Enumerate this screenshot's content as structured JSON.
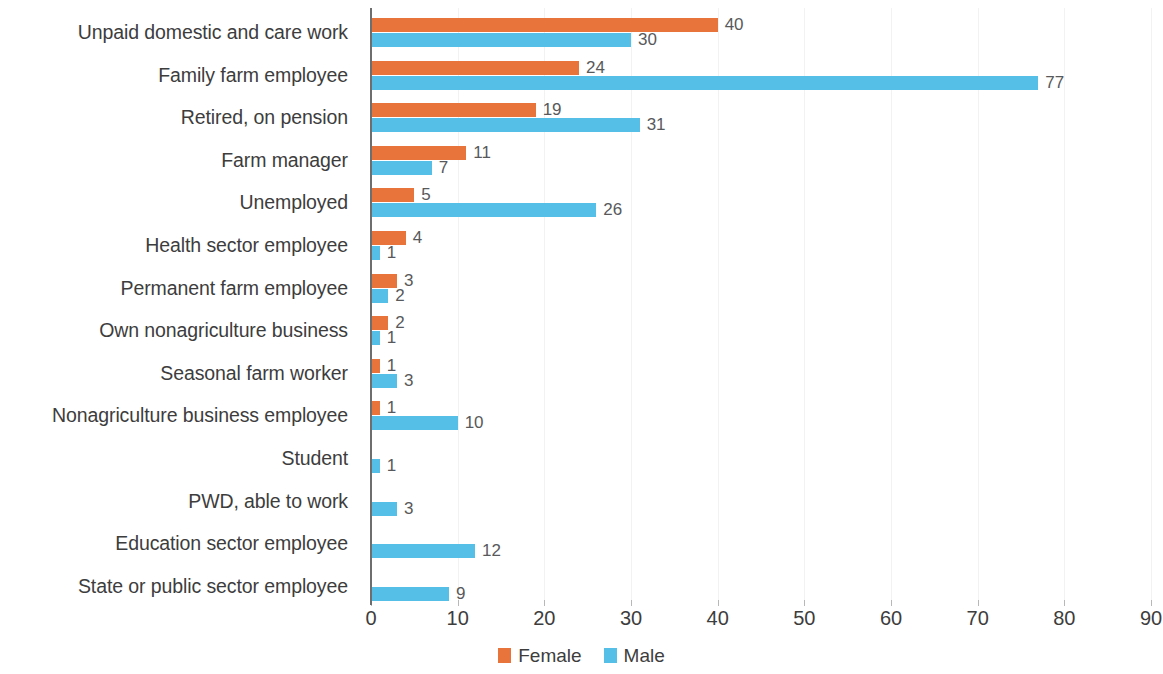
{
  "chart_data": {
    "type": "bar",
    "orientation": "horizontal",
    "title": "",
    "xlabel": "",
    "ylabel": "",
    "xlim": [
      0,
      90
    ],
    "xticks": [
      0,
      10,
      20,
      30,
      40,
      50,
      60,
      70,
      80,
      90
    ],
    "grid": true,
    "grid_axis": "x",
    "legend_position": "bottom-center",
    "categories": [
      "Unpaid domestic and care work",
      "Family farm employee",
      "Retired, on pension",
      "Farm manager",
      "Unemployed",
      "Health sector employee",
      "Permanent farm employee",
      "Own nonagriculture business",
      "Seasonal farm  worker",
      "Nonagriculture business employee",
      "Student",
      "PWD, able to work",
      "Education sector employee",
      "State or public sector employee"
    ],
    "series": [
      {
        "name": "Female",
        "color": "#e8743b",
        "values": [
          40,
          24,
          19,
          11,
          5,
          4,
          3,
          2,
          1,
          1,
          null,
          null,
          null,
          null
        ],
        "labels": [
          "40",
          "24",
          "19",
          "11",
          "5",
          "4",
          "3",
          "2",
          "1",
          "1",
          "",
          "",
          "",
          ""
        ]
      },
      {
        "name": "Male",
        "color": "#56bfe8",
        "values": [
          30,
          77,
          31,
          7,
          26,
          1,
          2,
          1,
          3,
          10,
          1,
          3,
          12,
          9
        ],
        "labels": [
          "30",
          "77",
          "31",
          "7",
          "26",
          "1",
          "2",
          "1",
          "3",
          "10",
          "1",
          "3",
          "12",
          "9"
        ]
      }
    ]
  },
  "legend": {
    "entries": [
      {
        "label": "Female",
        "color": "#e8743b",
        "swatch": "female"
      },
      {
        "label": "Male",
        "color": "#56bfe8",
        "swatch": "male"
      }
    ]
  },
  "colors": {
    "female": "#e8743b",
    "male": "#56bfe8",
    "axis": "#6e6e6e",
    "grid": "#f2f2f2",
    "text": "#3d3d3d",
    "value_text": "#58595b",
    "background": "#ffffff"
  }
}
